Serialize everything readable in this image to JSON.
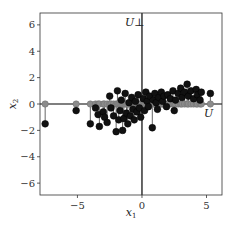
{
  "chart_data": {
    "type": "scatter",
    "title": "",
    "xlabel": "x_1",
    "ylabel": "x_2",
    "xlim": [
      -7.9,
      6.2
    ],
    "ylim": [
      -6.9,
      6.9
    ],
    "xticks": [
      -5,
      0,
      5
    ],
    "yticks": [
      -6,
      -4,
      -2,
      0,
      2,
      4,
      6
    ],
    "xtick_labels": [
      "−5",
      "0",
      "5"
    ],
    "ytick_labels": [
      "−6",
      "−4",
      "−2",
      "0",
      "2",
      "4",
      "6"
    ],
    "grid": false,
    "annotations": [
      {
        "text": "U⊥",
        "x": -0.3,
        "y": 6.2,
        "meaning": "orthogonal complement axis (vertical line x1=0)"
      },
      {
        "text": "U",
        "x": 5.4,
        "y": -0.9,
        "meaning": "subspace axis (horizontal line x2=0)"
      }
    ],
    "lines": [
      {
        "name": "U",
        "orientation": "horizontal",
        "value": 0,
        "color": "#000000"
      },
      {
        "name": "U_perp",
        "orientation": "vertical",
        "value": 0,
        "color": "#000000"
      }
    ],
    "series": [
      {
        "name": "original points",
        "color": "#111111",
        "marker": "circle",
        "points": [
          [
            -7.5,
            -1.5
          ],
          [
            -5.1,
            -0.5
          ],
          [
            -4.0,
            -1.5
          ],
          [
            -3.6,
            -0.3
          ],
          [
            -3.4,
            -0.8
          ],
          [
            -3.3,
            -1.7
          ],
          [
            -3.0,
            -0.6
          ],
          [
            -2.9,
            -1.0
          ],
          [
            -2.7,
            -1.4
          ],
          [
            -2.5,
            0.6
          ],
          [
            -2.4,
            -0.3
          ],
          [
            -2.2,
            -0.9
          ],
          [
            -2.0,
            -2.1
          ],
          [
            -1.9,
            1.0
          ],
          [
            -1.8,
            -1.2
          ],
          [
            -1.7,
            -0.5
          ],
          [
            -1.6,
            0.3
          ],
          [
            -1.5,
            -2.0
          ],
          [
            -1.4,
            -1.1
          ],
          [
            -1.3,
            0.8
          ],
          [
            -1.2,
            -0.7
          ],
          [
            -1.1,
            -1.5
          ],
          [
            -1.0,
            0.1
          ],
          [
            -0.9,
            -0.9
          ],
          [
            -0.8,
            0.5
          ],
          [
            -0.7,
            -0.4
          ],
          [
            -0.6,
            -1.2
          ],
          [
            -0.5,
            0.2
          ],
          [
            -0.4,
            -0.6
          ],
          [
            -0.3,
            0.7
          ],
          [
            -0.2,
            -0.3
          ],
          [
            -0.1,
            -1.0
          ],
          [
            0.1,
            0.4
          ],
          [
            0.2,
            -0.5
          ],
          [
            0.3,
            0.9
          ],
          [
            0.4,
            0.2
          ],
          [
            0.5,
            -0.2
          ],
          [
            0.6,
            0.6
          ],
          [
            0.8,
            -1.8
          ],
          [
            0.9,
            0.3
          ],
          [
            1.0,
            0.8
          ],
          [
            1.1,
            0.1
          ],
          [
            1.2,
            -0.4
          ],
          [
            1.3,
            0.5
          ],
          [
            1.5,
            0.9
          ],
          [
            1.6,
            0.2
          ],
          [
            1.7,
            0.6
          ],
          [
            1.9,
            -0.2
          ],
          [
            2.0,
            0.7
          ],
          [
            2.2,
            0.4
          ],
          [
            2.4,
            1.0
          ],
          [
            2.5,
            -0.5
          ],
          [
            2.6,
            0.3
          ],
          [
            2.8,
            0.8
          ],
          [
            3.0,
            1.2
          ],
          [
            3.1,
            0.5
          ],
          [
            3.3,
            0.9
          ],
          [
            3.5,
            1.5
          ],
          [
            3.6,
            0.6
          ],
          [
            3.8,
            1.0
          ],
          [
            4.0,
            0.4
          ],
          [
            4.2,
            1.1
          ],
          [
            4.3,
            0.7
          ],
          [
            4.5,
            0.3
          ],
          [
            4.6,
            0.9
          ],
          [
            5.3,
            0.8
          ]
        ]
      },
      {
        "name": "projections onto U",
        "color": "#8c8c8c",
        "marker": "circle",
        "description": "each original point projected to (x1, 0), connected by vertical stem"
      }
    ]
  }
}
